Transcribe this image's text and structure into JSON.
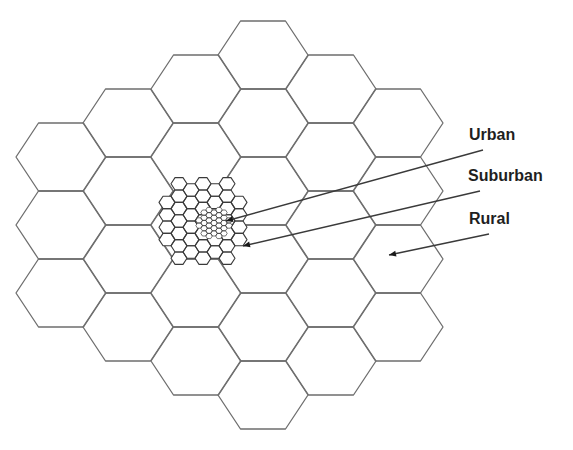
{
  "figure": {
    "colors": {
      "background": "#ffffff",
      "line": "#6e6e6e",
      "line_dark": "#3a3a3a",
      "text": "#1f1f1f"
    }
  },
  "macro_grid": {
    "side": 45,
    "row_height": 68,
    "columns": [
      {
        "cx": 61,
        "top": 123,
        "count": 3
      },
      {
        "cx": 128,
        "top": 89,
        "count": 4
      },
      {
        "cx": 196,
        "top": 55,
        "count": 5
      },
      {
        "cx": 263,
        "top": 21,
        "count": 6
      },
      {
        "cx": 331,
        "top": 55,
        "count": 5
      },
      {
        "cx": 398,
        "top": 89,
        "count": 4
      }
    ]
  },
  "suburban_cluster": {
    "center": [
      203,
      221
    ],
    "side": 8,
    "row_height": 12.4,
    "radius": 47
  },
  "urban_cluster": {
    "center": [
      214,
      223
    ],
    "side": 3.3,
    "row_height": 5.2,
    "radius": 16
  },
  "labels": [
    {
      "key": "urban",
      "text": "Urban",
      "x": 469,
      "y": 127,
      "line_from": [
        483,
        150
      ],
      "line_to": [
        226,
        221
      ]
    },
    {
      "key": "suburban",
      "text": "Suburban",
      "x": 468,
      "y": 168,
      "line_from": [
        480,
        191
      ],
      "line_to": [
        243,
        246
      ]
    },
    {
      "key": "rural",
      "text": "Rural",
      "x": 469,
      "y": 211,
      "line_from": [
        489,
        234
      ],
      "line_to": [
        389,
        255
      ]
    }
  ]
}
